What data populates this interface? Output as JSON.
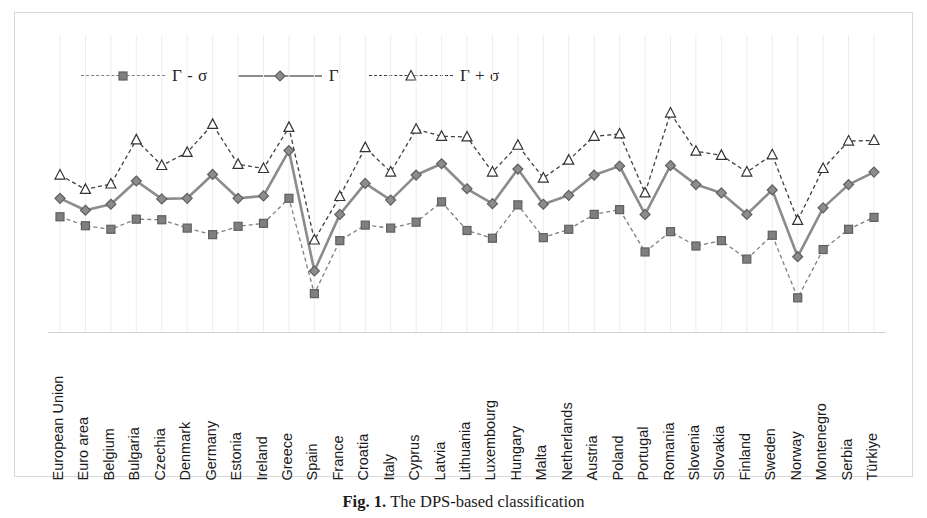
{
  "figure": {
    "caption_label": "Fig. 1.",
    "caption_text": "The DPS-based classification"
  },
  "legend": {
    "position": "top-left",
    "entries": [
      {
        "label": "Γ - σ",
        "marker": "square-marker",
        "style": "dashed",
        "color": "#7f7f7f"
      },
      {
        "label": "Γ",
        "marker": "diamond-marker",
        "style": "solid",
        "color": "#8c8c8c"
      },
      {
        "label": "Γ + σ",
        "marker": "triangle-marker",
        "style": "dashed",
        "color": "#404040"
      }
    ]
  },
  "chart_data": {
    "type": "line",
    "title": "",
    "xlabel": "",
    "ylabel": "",
    "grid": "vertical-only",
    "ylim": [
      0,
      1
    ],
    "categories": [
      "European Union",
      "Euro area",
      "Belgium",
      "Bulgaria",
      "Czechia",
      "Denmark",
      "Germany",
      "Estonia",
      "Ireland",
      "Greece",
      "Spain",
      "France",
      "Croatia",
      "Italy",
      "Cyprus",
      "Latvia",
      "Lithuania",
      "Luxembourg",
      "Hungary",
      "Malta",
      "Netherlands",
      "Austria",
      "Poland",
      "Portugal",
      "Romania",
      "Slovenia",
      "Slovakia",
      "Finland",
      "Sweden",
      "Norway",
      "Montenegro",
      "Serbia",
      "Türkiye"
    ],
    "series": [
      {
        "name": "Γ - σ",
        "marker": "square-marker",
        "style": "dashed",
        "color": "#7f7f7f",
        "values": [
          0.39,
          0.36,
          0.348,
          0.382,
          0.38,
          0.352,
          0.33,
          0.358,
          0.368,
          0.452,
          0.132,
          0.31,
          0.362,
          0.352,
          0.372,
          0.44,
          0.344,
          0.318,
          0.43,
          0.32,
          0.348,
          0.398,
          0.414,
          0.272,
          0.34,
          0.292,
          0.31,
          0.248,
          0.328,
          0.118,
          0.28,
          0.348,
          0.388
        ]
      },
      {
        "name": "Γ",
        "marker": "diamond-marker",
        "style": "solid",
        "color": "#8c8c8c",
        "values": [
          0.452,
          0.412,
          0.432,
          0.51,
          0.45,
          0.452,
          0.532,
          0.452,
          0.46,
          0.612,
          0.208,
          0.398,
          0.502,
          0.446,
          0.53,
          0.568,
          0.484,
          0.434,
          0.55,
          0.432,
          0.462,
          0.53,
          0.56,
          0.398,
          0.562,
          0.498,
          0.47,
          0.398,
          0.48,
          0.256,
          0.42,
          0.498,
          0.54
        ]
      },
      {
        "name": "Γ + σ",
        "marker": "triangle-marker",
        "style": "dashed",
        "color": "#404040",
        "values": [
          0.53,
          0.482,
          0.5,
          0.648,
          0.562,
          0.606,
          0.7,
          0.566,
          0.552,
          0.69,
          0.312,
          0.458,
          0.622,
          0.54,
          0.684,
          0.66,
          0.658,
          0.54,
          0.63,
          0.52,
          0.58,
          0.66,
          0.668,
          0.47,
          0.738,
          0.61,
          0.596,
          0.54,
          0.598,
          0.378,
          0.552,
          0.644,
          0.646
        ]
      }
    ]
  }
}
